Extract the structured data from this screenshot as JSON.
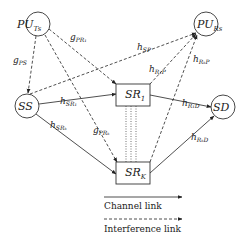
{
  "nodes": {
    "pu_ts": {
      "main": "PU",
      "sub": "Ts"
    },
    "pu_rs": {
      "main": "PU",
      "sub": "Rs"
    },
    "ss": {
      "main": "SS",
      "sub": ""
    },
    "sd": {
      "main": "SD",
      "sub": ""
    },
    "sr_1": {
      "main": "SR",
      "sub": "1"
    },
    "sr_k": {
      "main": "SR",
      "sub": "K"
    }
  },
  "edges": {
    "g_ps": {
      "main": "g",
      "sub": "PS",
      "type": "interference",
      "from": "PU_Ts",
      "to": "SS"
    },
    "g_pr1": {
      "main": "g",
      "sub": "PR₁",
      "type": "interference",
      "from": "PU_Ts",
      "to": "SR_1"
    },
    "g_prk": {
      "main": "g",
      "sub": "PRₖ",
      "type": "interference",
      "from": "PU_Ts",
      "to": "SR_K"
    },
    "h_sp": {
      "main": "h",
      "sub": "SP",
      "type": "interference",
      "from": "SS",
      "to": "PU_Rs"
    },
    "h_r1p": {
      "main": "h",
      "sub": "R₁P",
      "type": "interference",
      "from": "SR_1",
      "to": "PU_Rs"
    },
    "h_rkp": {
      "main": "h",
      "sub": "RₖP",
      "type": "interference",
      "from": "SR_K",
      "to": "PU_Rs"
    },
    "h_sr1": {
      "main": "h",
      "sub": "SR₁",
      "type": "channel",
      "from": "SS",
      "to": "SR_1"
    },
    "h_srk": {
      "main": "h",
      "sub": "SRₖ",
      "type": "channel",
      "from": "SS",
      "to": "SR_K"
    },
    "h_r1d": {
      "main": "h",
      "sub": "R₁D",
      "type": "channel",
      "from": "SR_1",
      "to": "SD"
    },
    "h_rkd": {
      "main": "h",
      "sub": "RₖD",
      "type": "channel",
      "from": "SR_K",
      "to": "SD"
    }
  },
  "legend": {
    "channel_link": "Channel link",
    "interference_link": "Interference link"
  },
  "colors": {
    "stroke": "#222222",
    "background": "#ffffff"
  }
}
